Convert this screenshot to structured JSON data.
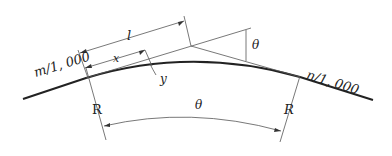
{
  "diagram": {
    "labels": {
      "left_grade": "m/1, 000",
      "right_grade": "n/1, 000",
      "tangent_length": "l",
      "x_offset": "x",
      "y_offset": "y",
      "top_angle": "θ",
      "center_angle": "θ",
      "left_radius": "R",
      "right_radius": "R"
    },
    "colors": {
      "line": "#222222",
      "thin": "#555555"
    }
  }
}
